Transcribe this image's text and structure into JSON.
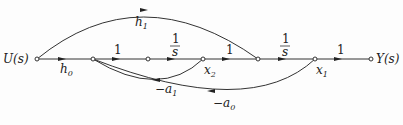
{
  "diagram": {
    "type": "signal-flow-graph",
    "nodes": [
      {
        "id": "U",
        "label": "U(s)"
      },
      {
        "id": "n1",
        "label": ""
      },
      {
        "id": "n2",
        "label": ""
      },
      {
        "id": "x2",
        "label": "x",
        "sub": "2"
      },
      {
        "id": "n4",
        "label": ""
      },
      {
        "id": "x1",
        "label": "x",
        "sub": "1"
      },
      {
        "id": "Y",
        "label": "Y(s)"
      }
    ],
    "edges": [
      {
        "from": "U",
        "to": "n1",
        "gain": "h",
        "gain_sub": "0"
      },
      {
        "from": "n1",
        "to": "n2",
        "gain": "1"
      },
      {
        "from": "n2",
        "to": "x2",
        "gain_num": "1",
        "gain_den": "s"
      },
      {
        "from": "x2",
        "to": "n4",
        "gain": "1"
      },
      {
        "from": "n4",
        "to": "x1",
        "gain_num": "1",
        "gain_den": "s"
      },
      {
        "from": "x1",
        "to": "Y",
        "gain": "1"
      },
      {
        "from": "U",
        "to": "n4",
        "gain": "h",
        "gain_sub": "1"
      },
      {
        "from": "x2",
        "to": "n1",
        "gain": "−a",
        "gain_sub": "1"
      },
      {
        "from": "x1",
        "to": "n1",
        "gain": "−a",
        "gain_sub": "0"
      }
    ]
  }
}
